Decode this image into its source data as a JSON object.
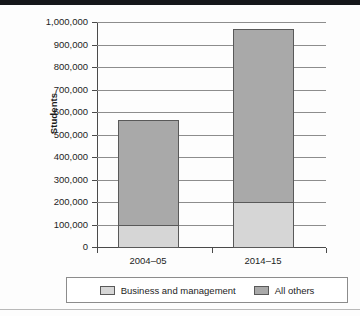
{
  "chart_data": {
    "type": "bar",
    "subtype": "stacked-bar",
    "title": "",
    "xlabel": "",
    "ylabel": "Students",
    "categories": [
      "2004–05",
      "2014–15"
    ],
    "series": [
      {
        "name": "Business and management",
        "values": [
          100000,
          200000
        ],
        "color": "#d6d6d6"
      },
      {
        "name": "All others",
        "values": [
          465000,
          770000
        ],
        "color": "#a9a9a9"
      }
    ],
    "totals": [
      565000,
      970000
    ],
    "ylim": [
      0,
      1000000
    ],
    "ytick_step": 100000,
    "ytick_labels": [
      "1,000,000",
      "900,000",
      "800,000",
      "700,000",
      "600,000",
      "500,000",
      "400,000",
      "300,000",
      "200,000",
      "100,000",
      "0"
    ],
    "ytick_values": [
      1000000,
      900000,
      800000,
      700000,
      600000,
      500000,
      400000,
      300000,
      200000,
      100000,
      0
    ],
    "grid": true,
    "grid_axis": "y",
    "legend_position": "bottom",
    "legend_entries": [
      "Business and management",
      "All others"
    ]
  },
  "axis": {
    "y_title": "Students"
  },
  "legend": {
    "items": [
      {
        "label": "Business and management",
        "color": "#d6d6d6"
      },
      {
        "label": "All others",
        "color": "#a9a9a9"
      }
    ]
  },
  "colors": {
    "business_and_management": "#d6d6d6",
    "all_others": "#a9a9a9",
    "gridline": "#8d8d8d",
    "axis": "#4a4a4a",
    "text": "#1d1d1d"
  }
}
